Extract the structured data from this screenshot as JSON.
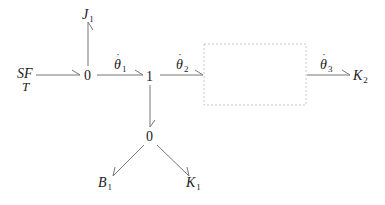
{
  "diagram": {
    "type": "bond-graph",
    "nodes": {
      "source": {
        "main": "SF",
        "sub": "T"
      },
      "j1": {
        "main": "J",
        "sub": "1"
      },
      "junction0_top": {
        "label": "0"
      },
      "junction1": {
        "label": "1"
      },
      "junction0_bottom": {
        "label": "0"
      },
      "b1": {
        "main": "B",
        "sub": "1"
      },
      "k1": {
        "main": "K",
        "sub": "1"
      },
      "k2": {
        "main": "K",
        "sub": "2"
      }
    },
    "bonds": {
      "theta1": {
        "main": "θ",
        "sub": "1",
        "dot": "˙"
      },
      "theta2": {
        "main": "θ",
        "sub": "2",
        "dot": "˙"
      },
      "theta3": {
        "main": "θ",
        "sub": "3",
        "dot": "˙"
      }
    },
    "placeholder_box": {
      "style": "dotted",
      "color": "#c8c8c8"
    },
    "colors": {
      "line": "#777777",
      "text": "#222222"
    }
  }
}
